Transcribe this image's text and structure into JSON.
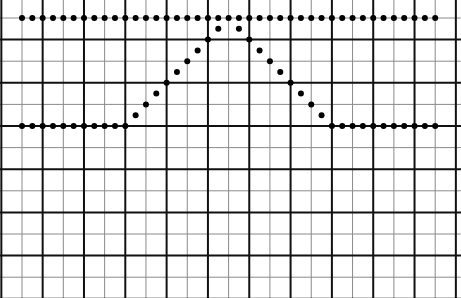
{
  "chart_data": {
    "type": "scatter",
    "title": "",
    "xlabel": "",
    "ylabel": "",
    "grid": true,
    "legend": "none",
    "x": [
      0,
      1,
      2,
      3,
      4,
      5,
      6,
      7,
      8,
      9,
      10,
      11,
      12,
      13,
      14,
      15,
      16,
      17,
      18,
      19,
      20,
      21,
      22,
      23,
      24,
      25,
      26,
      27,
      28,
      29,
      30,
      31,
      32,
      33,
      34,
      35,
      36,
      37,
      38,
      39,
      40
    ],
    "xlim": [
      -2,
      42
    ],
    "ylim": [
      -10,
      17.5
    ],
    "series": [
      {
        "name": "top-trace",
        "values": [
          10,
          10,
          10,
          10,
          10,
          10,
          10,
          10,
          10,
          10,
          10,
          10,
          10,
          10,
          10,
          10,
          10,
          10,
          10,
          10,
          10,
          10,
          10,
          10,
          10,
          10,
          10,
          10,
          10,
          10,
          10,
          10,
          10,
          10,
          10,
          10,
          10,
          10,
          10,
          10,
          10
        ]
      },
      {
        "name": "pulse-trace",
        "values": [
          0,
          0,
          0,
          0,
          0,
          0,
          0,
          0,
          0,
          0,
          0,
          1,
          2,
          3,
          4,
          5,
          6,
          7,
          8,
          9,
          null,
          9,
          8,
          7,
          6,
          5,
          4,
          3,
          2,
          1,
          0,
          0,
          0,
          0,
          0,
          0,
          0,
          0,
          0,
          0,
          0
        ]
      }
    ]
  },
  "style": {
    "grid_major_color": "#111111",
    "grid_minor_color": "#8a8a8a",
    "dot_color": "#000000",
    "background": "#ffffff"
  }
}
